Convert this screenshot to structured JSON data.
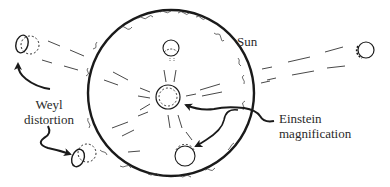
{
  "diagram": {
    "labels": {
      "sun": "Sun",
      "weyl_line1": "Weyl",
      "weyl_line2": "distortion",
      "einstein_line1": "Einstein",
      "einstein_line2": "magnification"
    },
    "colors": {
      "ink": "#1a1a1a",
      "text": "#2a2a2a",
      "background": "#ffffff"
    },
    "sun": {
      "cx": 171,
      "cy": 93,
      "r": 83
    },
    "objects": [
      {
        "name": "left-upper-object",
        "cx": 24,
        "cy": 44
      },
      {
        "name": "right-upper-object",
        "cx": 365,
        "cy": 50
      },
      {
        "name": "top-inner-object",
        "cx": 171,
        "cy": 48
      },
      {
        "name": "center-object",
        "cx": 168,
        "cy": 97
      },
      {
        "name": "bottom-inner-object",
        "cx": 185,
        "cy": 155
      },
      {
        "name": "left-lower-object",
        "cx": 80,
        "cy": 156
      }
    ]
  }
}
